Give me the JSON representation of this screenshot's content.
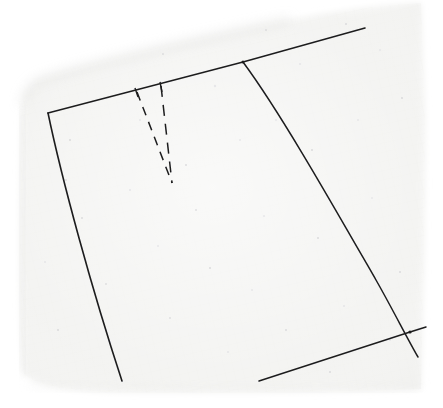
{
  "document": {
    "title": "Scanned sewing pattern sheet",
    "medium": "pencil line drawing on textured graph paper",
    "paper_color": "#f4f4f2",
    "paper_edge_color": "#e8e8e6",
    "ink_color": "#1d1d1f",
    "background_color": "#ffffff",
    "grain_dot_color": "#c9c9cd"
  },
  "canvas": {
    "width": 443,
    "height": 408
  },
  "paper": {
    "name": "paper-sheet",
    "outline_points": "22,104 38,80 96,60 186,40 286,20 352,8 420,4 424,160 422,300 420,388 300,392 170,392 60,390 24,372 18,240",
    "description": "slightly skewed rectangular scanned paper sheet with soft rounded scan edges"
  },
  "pattern": {
    "name": "pattern-piece",
    "description": "garment pattern panel with straight left seam, straight top edge, curved right side seam and a waist dart",
    "elements": [
      {
        "name": "top-edge-line",
        "type": "line",
        "path": "M 48 113 L 243 62 L 365 28",
        "stroke_width": 1.6,
        "label": "top / waist edge"
      },
      {
        "name": "left-seam-line",
        "type": "line",
        "path": "M 48 113 C 62 180 92 290 122 381",
        "stroke_width": 1.6,
        "label": "left straight grain seam"
      },
      {
        "name": "right-curved-seam",
        "type": "curve",
        "path": "M 243 62 C 280 112 330 200 376 280 C 392 308 408 340 418 357",
        "stroke_width": 1.5,
        "label": "right side seam, convex curve"
      },
      {
        "name": "bottom-hem-line",
        "type": "line",
        "path": "M 259 381 L 410 332 L 426 327",
        "stroke_width": 1.5,
        "label": "bottom / hem construction line"
      },
      {
        "name": "dart-left-leg",
        "type": "dashed-line",
        "path": "M 137 92 L 172 183",
        "stroke_width": 1.5,
        "dash": "9 7",
        "label": "dart left leg"
      },
      {
        "name": "dart-right-leg",
        "type": "dashed-line",
        "path": "M 161 86 L 172 183",
        "stroke_width": 1.5,
        "dash": "11 8",
        "label": "dart right leg"
      },
      {
        "name": "dart-left-tick",
        "type": "tick",
        "path": "M 135 88 L 138 97",
        "stroke_width": 1.4,
        "label": "dart notch on waistline (left)"
      },
      {
        "name": "dart-right-tick",
        "type": "tick",
        "path": "M 160 82 L 162 92",
        "stroke_width": 1.4,
        "label": "dart notch on waistline (right)"
      }
    ],
    "vertices": [
      {
        "name": "corner-top-left",
        "x": 48,
        "y": 113
      },
      {
        "name": "junction-top-right",
        "x": 243,
        "y": 62
      },
      {
        "name": "junction-bottom-right",
        "x": 410,
        "y": 332
      },
      {
        "name": "dart-apex",
        "x": 172,
        "y": 183
      }
    ]
  }
}
